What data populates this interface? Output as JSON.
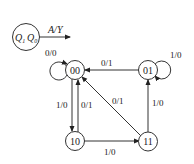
{
  "legend": {
    "state_vars": "Q1Q0",
    "q1": "Q",
    "q1_sub": "1",
    "q0": "Q",
    "q0_sub": "0",
    "io_label": "A/Y"
  },
  "states": [
    {
      "id": "00",
      "label": "00"
    },
    {
      "id": "01",
      "label": "01"
    },
    {
      "id": "10",
      "label": "10"
    },
    {
      "id": "11",
      "label": "11"
    }
  ],
  "transitions": [
    {
      "from": "00",
      "to": "00",
      "label": "0/0"
    },
    {
      "from": "01",
      "to": "00",
      "label": "0/1"
    },
    {
      "from": "01",
      "to": "01",
      "label": "1/0"
    },
    {
      "from": "00",
      "to": "10",
      "label": "1/0"
    },
    {
      "from": "10",
      "to": "00",
      "label": "0/1"
    },
    {
      "from": "11",
      "to": "00",
      "label": "0/1"
    },
    {
      "from": "11",
      "to": "01",
      "label": "1/0"
    },
    {
      "from": "10",
      "to": "11",
      "label": "1/0"
    }
  ],
  "colors": {
    "line": "#333333",
    "text": "#222222",
    "background": "#ffffff"
  }
}
